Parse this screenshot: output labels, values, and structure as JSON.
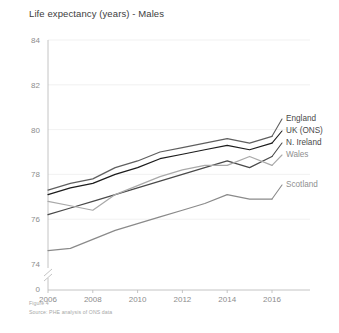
{
  "figure": {
    "title": "Life expectancy (years) - Males",
    "caption": "Figure 4",
    "source": "Source: PHE analysis of ONS data"
  },
  "axis": {
    "y_ticks": [
      "0",
      "74",
      "76",
      "78",
      "80",
      "82",
      "84"
    ],
    "x_ticks": [
      "2006",
      "2008",
      "2010",
      "2012",
      "2014",
      "2016"
    ],
    "y_break_marker": "axis-break"
  },
  "legend": {
    "items": [
      {
        "label": "England",
        "color": "#5f5f5f"
      },
      {
        "label": "UK (ONS)",
        "color": "#1c1c1c"
      },
      {
        "label": "N. Ireland",
        "color": "#4a4a4a"
      },
      {
        "label": "Wales",
        "color": "#a9a9a9"
      },
      {
        "label": "Scotland",
        "color": "#8a8a8a"
      }
    ]
  },
  "chart_data": {
    "type": "line",
    "title": "Life expectancy (years) - Males",
    "xlabel": "",
    "ylabel": "",
    "x": [
      2006,
      2007,
      2008,
      2009,
      2010,
      2011,
      2012,
      2013,
      2014,
      2015,
      2016
    ],
    "xlim": [
      2005.6,
      2016.6
    ],
    "ylim": [
      74,
      84
    ],
    "y_axis_has_break": true,
    "y_axis_break_below": 74,
    "grid": true,
    "legend_position": "right",
    "series": [
      {
        "name": "England",
        "color": "#5f5f5f",
        "values": [
          77.3,
          77.6,
          77.8,
          78.3,
          78.6,
          79.0,
          79.2,
          79.4,
          79.6,
          79.4,
          79.7
        ]
      },
      {
        "name": "UK (ONS)",
        "color": "#1c1c1c",
        "values": [
          77.1,
          77.4,
          77.6,
          78.0,
          78.3,
          78.7,
          78.9,
          79.1,
          79.3,
          79.1,
          79.4
        ]
      },
      {
        "name": "N. Ireland",
        "color": "#4a4a4a",
        "values": [
          76.2,
          76.5,
          76.8,
          77.1,
          77.4,
          77.7,
          78.0,
          78.3,
          78.6,
          78.3,
          78.8
        ]
      },
      {
        "name": "Wales",
        "color": "#a9a9a9",
        "values": [
          76.8,
          76.6,
          76.4,
          77.1,
          77.5,
          77.9,
          78.2,
          78.4,
          78.4,
          78.8,
          78.4
        ]
      },
      {
        "name": "Scotland",
        "color": "#8a8a8a",
        "values": [
          74.6,
          74.7,
          75.1,
          75.5,
          75.8,
          76.1,
          76.4,
          76.7,
          77.1,
          76.9,
          76.9
        ]
      }
    ]
  }
}
